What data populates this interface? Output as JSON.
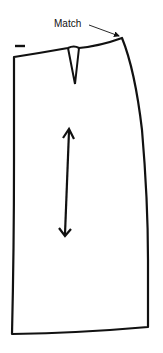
{
  "diagram": {
    "type": "sewing-pattern-piece",
    "annotation": {
      "label": "Match"
    },
    "colors": {
      "line": "#111111",
      "background": "#ffffff"
    },
    "elements": [
      "waistline",
      "waist-dart",
      "side-seam",
      "center-line",
      "hemline",
      "grainline-arrow",
      "match-pointer",
      "notch-mark"
    ]
  }
}
